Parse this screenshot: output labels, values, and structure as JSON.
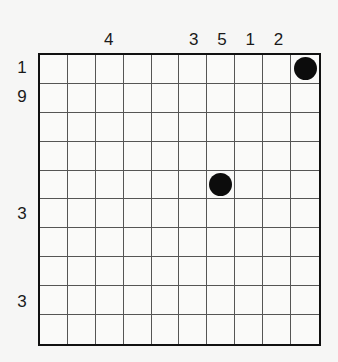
{
  "puzzle": {
    "rows": 10,
    "cols": 10,
    "column_clues": [
      "",
      "",
      "4",
      "",
      "",
      "3",
      "5",
      "1",
      "2",
      ""
    ],
    "row_clues": [
      "1",
      "9",
      "",
      "",
      "",
      "3",
      "",
      "",
      "3",
      ""
    ],
    "filled_cells": [
      {
        "row": 1,
        "col": 10
      },
      {
        "row": 5,
        "col": 7
      }
    ],
    "colors": {
      "grid_line": "#555555",
      "border": "#111111",
      "dot": "#0c0c0c",
      "background": "#f6f6f5"
    }
  }
}
